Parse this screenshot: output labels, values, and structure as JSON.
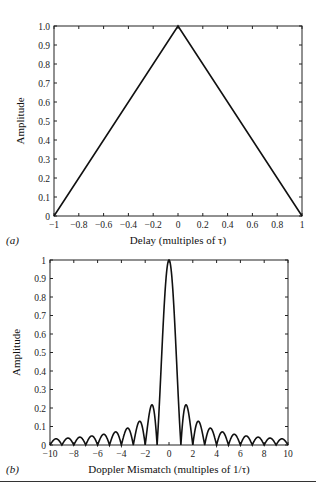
{
  "chart_data": [
    {
      "panel_label": "(a)",
      "type": "line",
      "title": "",
      "xlabel": "Delay (multiples of τ)",
      "ylabel": "Amplitude",
      "xlim": [
        -1,
        1
      ],
      "ylim": [
        0,
        1.0
      ],
      "xticks": [
        "-1",
        "-0.8",
        "-0.6",
        "-0.4",
        "-0.2",
        "0",
        "0.2",
        "0.4",
        "0.6",
        "0.8",
        "1"
      ],
      "yticks": [
        "0",
        "0.1",
        "0.2",
        "0.3",
        "0.4",
        "0.5",
        "0.6",
        "0.7",
        "0.8",
        "0.9",
        "1.0"
      ],
      "grid": false,
      "series": [
        {
          "name": "triangle",
          "x": [
            -1,
            0,
            1
          ],
          "y": [
            0,
            1.0,
            0
          ]
        }
      ]
    },
    {
      "panel_label": "(b)",
      "type": "line",
      "title": "",
      "xlabel": "Doppler Mismatch (multiples of 1/τ)",
      "ylabel": "Amplitude",
      "xlim": [
        -10,
        10
      ],
      "ylim": [
        0,
        1
      ],
      "xticks": [
        "-10",
        "-8",
        "-6",
        "-4",
        "-2",
        "0",
        "2",
        "4",
        "6",
        "8",
        "10"
      ],
      "yticks": [
        "0",
        "0.1",
        "0.2",
        "0.3",
        "0.4",
        "0.5",
        "0.6",
        "0.7",
        "0.8",
        "0.9",
        "1"
      ],
      "grid": false,
      "series": [
        {
          "name": "|sinc(fτ)|",
          "function": "abs_sinc",
          "peaks_x": [
            0,
            1.43,
            2.46,
            3.47,
            4.48,
            5.48,
            6.49,
            7.49,
            8.49,
            9.49
          ],
          "peaks_y": [
            1.0,
            0.217,
            0.128,
            0.091,
            0.071,
            0.058,
            0.049,
            0.042,
            0.037,
            0.034
          ],
          "zeros_x": [
            -10,
            -9,
            -8,
            -7,
            -6,
            -5,
            -4,
            -3,
            -2,
            -1,
            1,
            2,
            3,
            4,
            5,
            6,
            7,
            8,
            9,
            10
          ]
        }
      ]
    }
  ]
}
